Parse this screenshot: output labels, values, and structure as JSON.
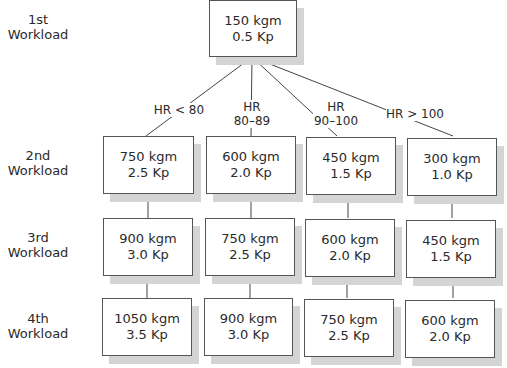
{
  "row_labels": [
    {
      "line1": "1st",
      "line2": "Workload"
    },
    {
      "line1": "2nd",
      "line2": "Workload"
    },
    {
      "line1": "3rd",
      "line2": "Workload"
    },
    {
      "line1": "4th",
      "line2": "Workload"
    }
  ],
  "root": {
    "work": "150 kgm",
    "load": "0.5 Kp"
  },
  "branches": [
    {
      "condition_line1": "HR < 80",
      "condition_line2": ""
    },
    {
      "condition_line1": "HR",
      "condition_line2": "80–89"
    },
    {
      "condition_line1": "HR",
      "condition_line2": "90–100"
    },
    {
      "condition_line1": "HR > 100",
      "condition_line2": ""
    }
  ],
  "columns": [
    {
      "second": {
        "work": "750 kgm",
        "load": "2.5 Kp"
      },
      "third": {
        "work": "900 kgm",
        "load": "3.0 Kp"
      },
      "fourth": {
        "work": "1050 kgm",
        "load": "3.5 Kp"
      }
    },
    {
      "second": {
        "work": "600 kgm",
        "load": "2.0 Kp"
      },
      "third": {
        "work": "750 kgm",
        "load": "2.5 Kp"
      },
      "fourth": {
        "work": "900 kgm",
        "load": "3.0 Kp"
      }
    },
    {
      "second": {
        "work": "450 kgm",
        "load": "1.5 Kp"
      },
      "third": {
        "work": "600 kgm",
        "load": "2.0 Kp"
      },
      "fourth": {
        "work": "750 kgm",
        "load": "2.5 Kp"
      }
    },
    {
      "second": {
        "work": "300 kgm",
        "load": "1.0 Kp"
      },
      "third": {
        "work": "450 kgm",
        "load": "1.5 Kp"
      },
      "fourth": {
        "work": "600 kgm",
        "load": "2.0 Kp"
      }
    }
  ]
}
